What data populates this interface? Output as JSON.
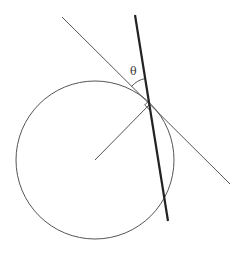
{
  "diagram": {
    "type": "geometry",
    "labels": {
      "angle": "θ"
    },
    "colors": {
      "stroke": "#555555",
      "thick_stroke": "#222222",
      "background": "#ffffff"
    },
    "circle": {
      "cx": 95,
      "cy": 160,
      "r": 79
    },
    "tangent_point": {
      "x": 149,
      "y": 105
    },
    "tangent_line": {
      "x1": 62,
      "y1": 17,
      "x2": 230,
      "y2": 184
    },
    "thick_line": {
      "x1": 135,
      "y1": 15,
      "x2": 168,
      "y2": 221
    },
    "radius_line": {
      "x1": 95,
      "y1": 160,
      "x2": 149,
      "y2": 105
    }
  }
}
